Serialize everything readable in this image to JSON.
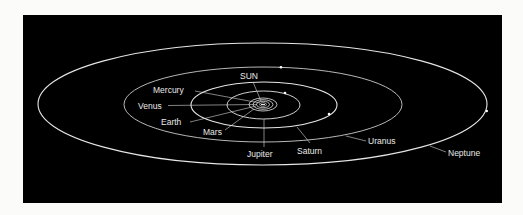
{
  "diagram": {
    "colors": {
      "background": "#fbfbfa",
      "panel": "#000000",
      "orbit": "#e6e6e6",
      "text": "#e8e8e8"
    },
    "center": {
      "x": 263,
      "y": 104
    },
    "sun": {
      "label": "SUN",
      "label_x": 254,
      "label_y": 79
    },
    "inner_planets": [
      {
        "name": "Mercury",
        "label": "Mercury",
        "rx": 3,
        "ry": 1.6,
        "label_x": 155,
        "label_y": 91
      },
      {
        "name": "Venus",
        "label": "Venus",
        "rx": 6,
        "ry": 3,
        "label_x": 138,
        "label_y": 108
      },
      {
        "name": "Earth",
        "label": "Earth",
        "rx": 9.5,
        "ry": 4.5,
        "label_x": 162,
        "label_y": 125
      },
      {
        "name": "Mars",
        "label": "Mars",
        "rx": 14,
        "ry": 6.5,
        "label_x": 204,
        "label_y": 134
      }
    ],
    "outer_planets": [
      {
        "name": "Jupiter",
        "label": "Jupiter",
        "rx": 36.5,
        "ry": 14,
        "planet_x": 285,
        "planet_y": 93,
        "label_x": 248,
        "label_y": 157
      },
      {
        "name": "Saturn",
        "label": "Saturn",
        "rx": 73,
        "ry": 23,
        "planet_x": 329,
        "planet_y": 114,
        "label_x": 297,
        "label_y": 154
      },
      {
        "name": "Uranus",
        "label": "Uranus",
        "rx": 139,
        "ry": 37.5,
        "planet_x": 281,
        "planet_y": 67,
        "label_x": 369,
        "label_y": 144
      },
      {
        "name": "Neptune",
        "label": "Neptune",
        "rx": 224.5,
        "ry": 61,
        "planet_x": 487,
        "planet_y": 111,
        "label_x": 448,
        "label_y": 156
      }
    ]
  }
}
